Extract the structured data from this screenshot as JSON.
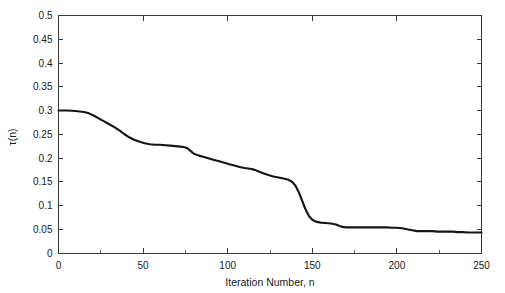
{
  "chart_data": {
    "type": "line",
    "title": "",
    "xlabel": "Iteration Number, n",
    "ylabel": "τ(n)",
    "xlim": [
      0,
      250
    ],
    "ylim": [
      0,
      0.5
    ],
    "grid": false,
    "legend": null,
    "x_ticks": [
      0,
      50,
      100,
      150,
      200,
      250
    ],
    "x_tick_labels": [
      "0",
      "50",
      "100",
      "150",
      "200",
      "250"
    ],
    "x_minor_ticks": [
      25,
      75,
      125,
      175,
      225
    ],
    "y_ticks": [
      0,
      0.05,
      0.1,
      0.15,
      0.2,
      0.25,
      0.3,
      0.35,
      0.4,
      0.45,
      0.5
    ],
    "y_tick_labels": [
      "0",
      "0.05",
      "0.1",
      "0.15",
      "0.2",
      "0.25",
      "0.3",
      "0.35",
      "0.4",
      "0.45",
      "0.5"
    ],
    "series": [
      {
        "name": "tau(n)",
        "color": "#141414",
        "line_width": 2.1,
        "x": [
          0,
          5,
          10,
          15,
          18,
          21,
          24,
          27,
          30,
          33,
          36,
          39,
          42,
          45,
          48,
          51,
          54,
          57,
          60,
          63,
          66,
          69,
          72,
          74,
          76,
          78,
          80,
          83,
          86,
          89,
          92,
          95,
          98,
          101,
          104,
          107,
          110,
          112,
          114,
          116,
          118,
          121,
          124,
          127,
          130,
          133,
          136,
          138,
          140,
          142,
          144,
          146,
          148,
          150,
          152,
          155,
          158,
          161,
          164,
          166,
          168,
          170,
          173,
          176,
          179,
          182,
          185,
          188,
          191,
          194,
          197,
          200,
          203,
          206,
          209,
          212,
          215,
          218,
          221,
          224,
          227,
          230,
          233,
          236,
          239,
          242,
          245,
          248,
          250
        ],
        "y": [
          0.3,
          0.3,
          0.299,
          0.297,
          0.294,
          0.289,
          0.283,
          0.277,
          0.271,
          0.265,
          0.258,
          0.25,
          0.243,
          0.238,
          0.234,
          0.231,
          0.229,
          0.228,
          0.228,
          0.227,
          0.226,
          0.225,
          0.224,
          0.223,
          0.221,
          0.215,
          0.209,
          0.205,
          0.202,
          0.199,
          0.196,
          0.193,
          0.19,
          0.187,
          0.184,
          0.181,
          0.179,
          0.178,
          0.177,
          0.175,
          0.172,
          0.168,
          0.164,
          0.161,
          0.159,
          0.157,
          0.154,
          0.15,
          0.142,
          0.128,
          0.11,
          0.092,
          0.078,
          0.07,
          0.066,
          0.064,
          0.063,
          0.062,
          0.06,
          0.057,
          0.055,
          0.054,
          0.054,
          0.054,
          0.054,
          0.054,
          0.054,
          0.054,
          0.054,
          0.054,
          0.053,
          0.053,
          0.052,
          0.05,
          0.048,
          0.046,
          0.046,
          0.046,
          0.046,
          0.045,
          0.045,
          0.045,
          0.045,
          0.044,
          0.044,
          0.043,
          0.043,
          0.043,
          0.043
        ]
      }
    ]
  },
  "figure": {
    "background_color": "#ffffff",
    "axes_color": "#3a3a3a"
  }
}
